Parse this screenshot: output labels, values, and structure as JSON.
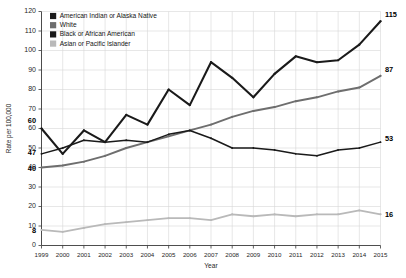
{
  "chart_data": {
    "type": "line",
    "title": "",
    "xlabel": "Year",
    "ylabel": "Rate per 100,000",
    "grid": true,
    "legend_position": "top-left",
    "xlim": [
      1999,
      2015
    ],
    "ylim": [
      0,
      120
    ],
    "ytick_step": 10,
    "x": [
      1999,
      2000,
      2001,
      2002,
      2003,
      2004,
      2005,
      2006,
      2007,
      2008,
      2009,
      2010,
      2011,
      2012,
      2013,
      2014,
      2015
    ],
    "xtick_labels": [
      "1999",
      "2000",
      "2001",
      "2002",
      "2003",
      "2004",
      "2005",
      "2006",
      "2007",
      "2008",
      "2009",
      "2010",
      "2011",
      "2012",
      "2013",
      "2014",
      "2015"
    ],
    "ytick_labels": [
      "0",
      "10",
      "20",
      "30",
      "40",
      "50",
      "60",
      "70",
      "80",
      "90",
      "100",
      "110",
      "120"
    ],
    "series": [
      {
        "name": "American Indian or Alaska Native",
        "color": "#1a1a1a",
        "width": 2.1,
        "values": [
          60,
          47,
          59,
          53,
          67,
          62,
          80,
          72,
          94,
          86,
          76,
          88,
          97,
          94,
          95,
          103,
          115
        ],
        "start_label": "60",
        "end_label": "115"
      },
      {
        "name": "White",
        "color": "#6e6e6e",
        "width": 1.9,
        "values": [
          40,
          41,
          43,
          46,
          50,
          53,
          56,
          59,
          62,
          66,
          69,
          71,
          74,
          76,
          79,
          81,
          87
        ],
        "start_label": "40",
        "end_label": "87"
      },
      {
        "name": "Black or African American",
        "color": "#1a1a1a",
        "width": 1.5,
        "values": [
          47,
          50,
          54,
          53,
          54,
          53,
          57,
          59,
          55,
          50,
          50,
          49,
          47,
          46,
          49,
          50,
          53
        ],
        "start_label": "47",
        "end_label": "53"
      },
      {
        "name": "Asian or Pacific Islander",
        "color": "#b9b9b9",
        "width": 1.8,
        "values": [
          8,
          7,
          9,
          11,
          12,
          13,
          14,
          14,
          13,
          16,
          15,
          16,
          15,
          16,
          16,
          18,
          16
        ],
        "start_label": "8",
        "end_label": "16"
      }
    ]
  },
  "legend": {
    "items": [
      {
        "label": "American Indian or Alaska Native",
        "color": "#1a1a1a"
      },
      {
        "label": "White",
        "color": "#6e6e6e"
      },
      {
        "label": "Black or African American",
        "color": "#1a1a1a"
      },
      {
        "label": "Asian or Pacific Islander",
        "color": "#b9b9b9"
      }
    ]
  }
}
